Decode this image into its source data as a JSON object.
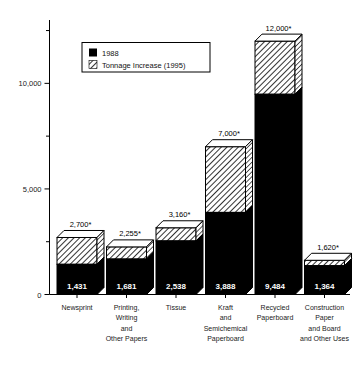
{
  "chart_data": {
    "type": "bar",
    "title": "",
    "subtitle": "",
    "xlabel": "",
    "ylabel": "",
    "ylim": [
      0,
      13000
    ],
    "yticks": [
      0,
      5000,
      10000
    ],
    "ytick_labels": [
      "0",
      "5,000",
      "10,000"
    ],
    "yminor_ticks": [
      2500,
      7500,
      12500
    ],
    "grid": false,
    "stacked": true,
    "legend_position": "top-left-inside",
    "categories": [
      "Newsprint",
      "Printing, Writing and Other Papers",
      "Tissue",
      "Kraft and Semichemical Paperboard",
      "Recycled Paperboard",
      "Construction Paper and Board and Other Uses"
    ],
    "category_lines": [
      [
        "Newsprint"
      ],
      [
        "Printing,",
        "Writing",
        "and",
        "Other Papers"
      ],
      [
        "Tissue"
      ],
      [
        "Kraft",
        "and",
        "Semichemical",
        "Paperboard"
      ],
      [
        "Recycled",
        "Paperboard"
      ],
      [
        "Construction",
        "Paper",
        "and Board",
        "and Other Uses"
      ]
    ],
    "series": [
      {
        "name": "1988",
        "fill": "solid-black",
        "color": "#000000",
        "values": [
          1431,
          1681,
          2538,
          3888,
          9484,
          1364
        ]
      },
      {
        "name": "Tonnage Increase (1995)",
        "fill": "diagonal-hatch",
        "color": "#ffffff",
        "values": [
          1269,
          574,
          622,
          3112,
          2516,
          256
        ]
      }
    ],
    "totals": [
      2700,
      2255,
      3160,
      7000,
      12000,
      1620
    ],
    "total_labels": [
      "2,700*",
      "2,255*",
      "3,160*",
      "7,000*",
      "12,000*",
      "1,620*"
    ],
    "base_labels": [
      "1,431",
      "1,681",
      "2,538",
      "3,888",
      "9,484",
      "1,364"
    ],
    "annotations": [
      "* denotes projected total"
    ]
  },
  "legend": {
    "items": [
      {
        "label": "1988",
        "swatch": "solid-black"
      },
      {
        "label": "Tonnage Increase (1995)",
        "swatch": "diagonal-hatch"
      }
    ]
  },
  "colors": {
    "bar_base": "#000000",
    "bar_increase": "#ffffff",
    "hatch_stroke": "#000000",
    "axis": "#000000",
    "background": "#ffffff",
    "text": "#000000",
    "label_on_bar": "#ffffff"
  }
}
